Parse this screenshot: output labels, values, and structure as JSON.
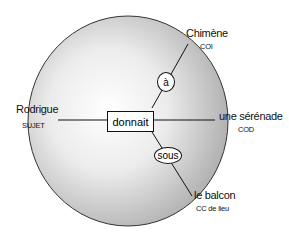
{
  "diagram": {
    "type": "sentence-structure",
    "verb": "donnait",
    "nodes": {
      "subject": {
        "word": "Rodrigue",
        "function": "SUJET"
      },
      "direct_object": {
        "word": "une sérénade",
        "function": "COD"
      },
      "indirect_object": {
        "word": "Chimène",
        "function": "COI",
        "preposition": "à"
      },
      "place_complement": {
        "word": "le balcon",
        "function": "CC de lieu",
        "preposition": "sous"
      }
    },
    "colors": {
      "stroke": "#111111",
      "sphere_light": "#ffffff",
      "sphere_dark": "#b8b8b8"
    }
  }
}
